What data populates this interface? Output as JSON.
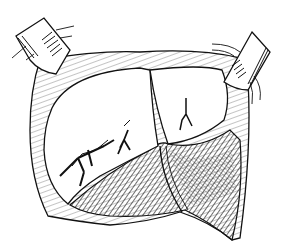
{
  "illustration": {
    "style": "black-and-white line drawing",
    "subject": "surgical exposure with two retractors holding open a tissue cavity containing two white lobes with fissure marks and hatched tissue below",
    "colors": {
      "background": "#ffffff",
      "ink": "#111111",
      "shade": "#555555"
    },
    "elements": {
      "left_retractor": "retractor blade upper-left with tie lines",
      "right_retractor": "retractor blade upper-right with tie lines",
      "left_lobe": "large white lobe with three branching fissures",
      "right_lobe": "smaller white lobe with one branching fissure",
      "lower_tissue": "cross-hatched tissue flap at bottom",
      "wall": "hatched tissue wall framing the cavity"
    }
  }
}
